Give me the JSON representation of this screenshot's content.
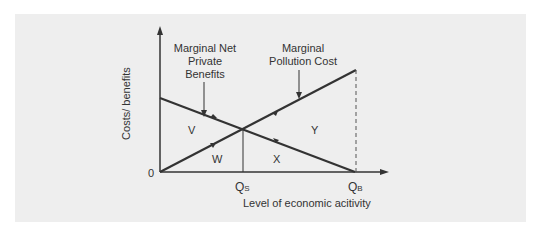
{
  "diagram": {
    "y_axis_label": "Costs/ benefits",
    "x_axis_label": "Level of economic acitivity",
    "origin_label": "0",
    "curve_labels": {
      "mnpb_line1": "Marginal Net",
      "mnpb_line2": "Private",
      "mnpb_line3": "Benefits",
      "mpc_line1": "Marginal",
      "mpc_line2": "Pollution Cost"
    },
    "x_ticks": {
      "qs": {
        "main": "Q",
        "sub": "S"
      },
      "qb": {
        "main": "Q",
        "sub": "B"
      }
    },
    "regions": [
      "V",
      "W",
      "X",
      "Y"
    ],
    "colors": {
      "panel": "#eeeeee",
      "line": "#333333"
    }
  }
}
